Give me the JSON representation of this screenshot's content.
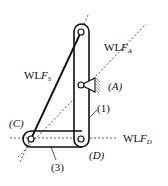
{
  "labels": {
    "wlf_s": {
      "prefix": "WL",
      "var": "F",
      "sub": "S"
    },
    "wlf_a": {
      "prefix": "WL",
      "var": "F",
      "sub": "A"
    },
    "wlf_d": {
      "prefix": "WL",
      "var": "F",
      "sub": "D"
    },
    "point_a": "(A)",
    "point_c": "(C)",
    "point_d": "(D)",
    "link_1": "(1)",
    "link_3": "(3)"
  },
  "colors": {
    "line": "#111111",
    "background": "#ffffff"
  }
}
